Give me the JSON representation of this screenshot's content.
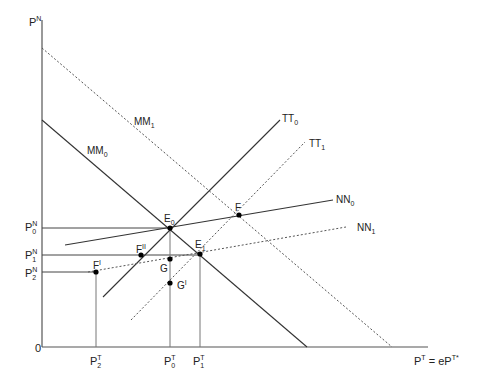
{
  "diagram": {
    "axes": {
      "y_label": {
        "base": "P",
        "sup": "N"
      },
      "x_label": {
        "base": "P",
        "sup": "T",
        "rest": " = eP",
        "rest_sup": "T*"
      },
      "origin": "0"
    },
    "curves": {
      "MM0": {
        "base": "MM",
        "sub": "0",
        "style": "solid"
      },
      "MM1": {
        "base": "MM",
        "sub": "1",
        "style": "dashed"
      },
      "TT0": {
        "base": "TT",
        "sub": "0",
        "style": "solid"
      },
      "TT1": {
        "base": "TT",
        "sub": "1",
        "style": "dashed"
      },
      "NN0": {
        "base": "NN",
        "sub": "0",
        "style": "solid"
      },
      "NN1": {
        "base": "NN",
        "sub": "1",
        "style": "dashed"
      }
    },
    "points": {
      "E0": {
        "base": "E",
        "sub": "0"
      },
      "E1": {
        "base": "E",
        "sub": "1"
      },
      "F": {
        "base": "F",
        "sup": ""
      },
      "FII": {
        "base": "F",
        "sup": "II"
      },
      "FI": {
        "base": "F",
        "sup": "I"
      },
      "G": {
        "base": "G",
        "sup": ""
      },
      "GI": {
        "base": "G",
        "sup": "I"
      }
    },
    "y_ticks": [
      {
        "base": "P",
        "sub": "0",
        "sup": "N"
      },
      {
        "base": "P",
        "sub": "1",
        "sup": "N"
      },
      {
        "base": "P",
        "sub": "2",
        "sup": "N"
      }
    ],
    "x_ticks": [
      {
        "base": "P",
        "sub": "2",
        "sup": "T"
      },
      {
        "base": "P",
        "sub": "0",
        "sup": "T"
      },
      {
        "base": "P",
        "sub": "1",
        "sup": "T"
      }
    ],
    "colors": {
      "line": "#333333",
      "dashed": "#555555",
      "point": "#000000"
    }
  }
}
